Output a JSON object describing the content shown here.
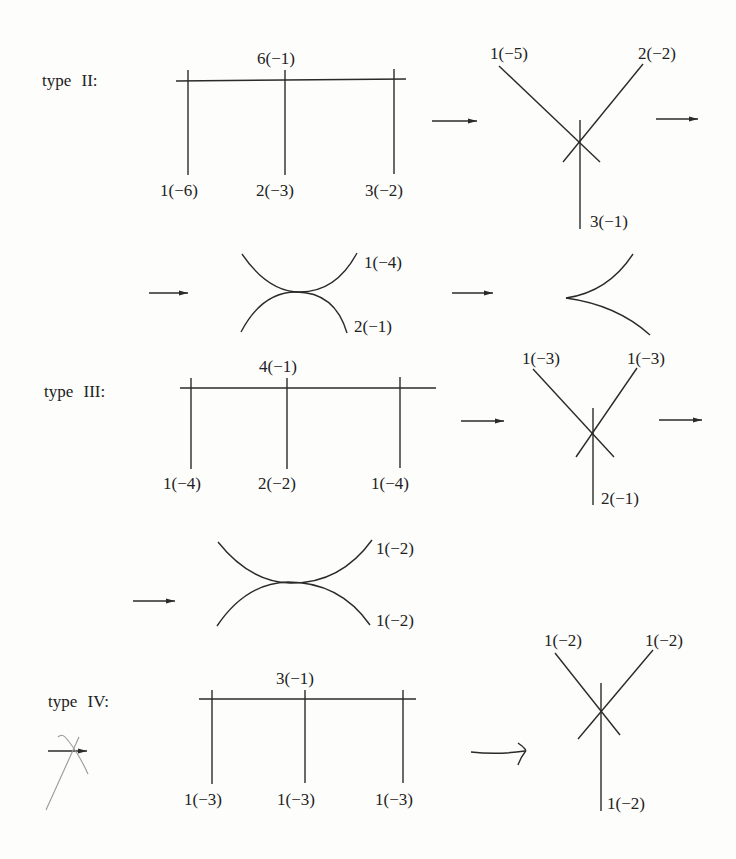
{
  "figure": {
    "type_ii": {
      "label": "type II:",
      "tree": {
        "top": "6(−1)",
        "leaves": [
          "1(−6)",
          "2(−3)",
          "3(−2)"
        ]
      },
      "star": {
        "top_left": "1(−5)",
        "top_right": "2(−2)",
        "bottom": "3(−1)"
      },
      "tangent": {
        "upper": "1(−4)",
        "lower": "2(−1)"
      },
      "cusp": "cusp-curve"
    },
    "type_iii": {
      "label": "type III:",
      "tree": {
        "top": "4(−1)",
        "leaves": [
          "1(−4)",
          "2(−2)",
          "1(−4)"
        ]
      },
      "star": {
        "top_left": "1(−3)",
        "top_right": "1(−3)",
        "bottom": "2(−1)"
      },
      "tangent": {
        "upper": "1(−2)",
        "lower": "1(−2)"
      }
    },
    "type_iv": {
      "label": "type IV:",
      "tree": {
        "top": "3(−1)",
        "leaves": [
          "1(−3)",
          "1(−3)",
          "1(−3)"
        ]
      },
      "star": {
        "top_left": "1(−2)",
        "top_right": "1(−2)",
        "bottom": "1(−2)"
      }
    },
    "icons": {
      "arrow": "right-arrow",
      "handwritten_arrow": "hand-drawn-right-arrow",
      "crossed_arrow": "crossed-out-arrow"
    }
  }
}
